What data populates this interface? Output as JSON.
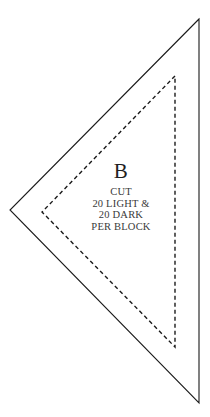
{
  "document": {
    "type": "quilt-pattern-template",
    "background_color": "#ffffff",
    "width": 210,
    "height": 417
  },
  "shapes": {
    "cutting_line": {
      "name": "outer-cutting-triangle",
      "style": "solid",
      "stroke_color": "#1a1a1a",
      "stroke_width": 1.1,
      "points": "199,19 10,210 199,403"
    },
    "seam_line": {
      "name": "inner-seam-triangle",
      "style": "dashed",
      "stroke_color": "#1a1a1a",
      "stroke_width": 1.4,
      "dash_pattern": "4,3",
      "points": "175,76 42,212 175,347"
    }
  },
  "labels": {
    "piece_letter": "B",
    "instructions": [
      "CUT",
      "20 LIGHT &",
      "20 DARK",
      "PER BLOCK"
    ]
  }
}
